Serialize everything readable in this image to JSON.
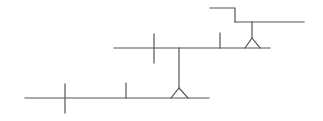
{
  "diagram": {
    "type": "cascading-line-diagram",
    "stroke_color": "#555555",
    "background": "#ffffff",
    "levels": [
      {
        "name": "top-level",
        "step_inlet": {
          "from": [
            210,
            8
          ],
          "corner": [
            235,
            8
          ],
          "down_to": [
            235,
            22
          ]
        },
        "line": {
          "x1": 235,
          "x2": 304,
          "y": 22
        },
        "drop": {
          "x": 252,
          "from_y": 22,
          "to_y": 38
        },
        "support_triangle": {
          "apex": [
            252,
            38
          ],
          "base_left": [
            245,
            48
          ],
          "base_right": [
            260,
            48
          ]
        }
      },
      {
        "name": "middle-level",
        "line": {
          "x1": 114,
          "x2": 270,
          "y": 48
        },
        "cross": {
          "x": 154,
          "y1": 34,
          "y2": 63
        },
        "tick": {
          "x": 220,
          "y1": 33,
          "y2": 48
        },
        "drop": {
          "x": 179,
          "from_y": 48,
          "to_y": 88
        },
        "support_triangle": {
          "apex": [
            179,
            88
          ],
          "base_left": [
            171,
            98
          ],
          "base_right": [
            188,
            98
          ]
        }
      },
      {
        "name": "bottom-level",
        "line": {
          "x1": 25,
          "x2": 209,
          "y": 98
        },
        "cross": {
          "x": 65,
          "y1": 84,
          "y2": 113
        },
        "tick": {
          "x": 126,
          "y1": 83,
          "y2": 98
        }
      }
    ]
  }
}
